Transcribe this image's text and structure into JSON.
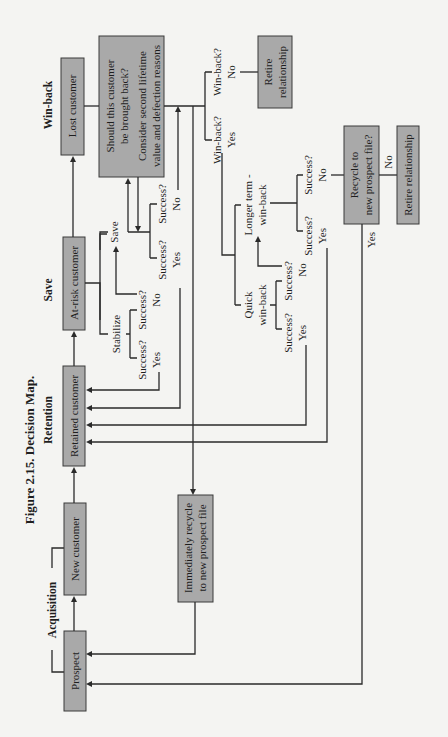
{
  "figure": {
    "title": "Figure 2.15.  Decision Map."
  },
  "stages": {
    "acquisition": "Acquisition",
    "retention": "Retention",
    "save": "Save",
    "winback": "Win-back"
  },
  "boxes": {
    "prospect": "Prospect",
    "new_customer": "New customer",
    "retained_customer": "Retained customer",
    "at_risk_customer": "At-risk customer",
    "lost_customer": "Lost customer",
    "should_line1": "Should this customer",
    "should_line2": "be brought back?",
    "should_line3": "Consider second lifetime",
    "should_line4": "value and defection reasons",
    "retire_top_line1": "Retire",
    "retire_top_line2": "relationship",
    "recycle_line1": "Recycle to",
    "recycle_line2": "new prospect file?",
    "retire_bottom": "Retire relationship",
    "immediate_line1": "Immediately recycle",
    "immediate_line2": "to new prospect file"
  },
  "branches": {
    "stabilize": "Stabilize",
    "save": "Save",
    "quick_line1": "Quick",
    "quick_line2": "win-back",
    "longer_line1": "Longer term -",
    "longer_line2": "win-back"
  },
  "labels": {
    "success": "Success?",
    "yes": "Yes",
    "no": "No",
    "winback_q": "Win-back?"
  }
}
